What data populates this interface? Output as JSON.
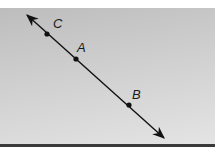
{
  "figure": {
    "type": "line-through-points",
    "colors": {
      "panel_top": "#bdbdbd",
      "panel_bottom": "#e4e4e4",
      "line": "#111111",
      "bottom_rule": "#3a3a3a"
    },
    "line": {
      "x1": 27,
      "y1": 15,
      "x2": 164,
      "y2": 138,
      "arrows": "both"
    },
    "points": [
      {
        "label": "C",
        "x": 47,
        "y": 34,
        "label_x": 55,
        "label_y": 27
      },
      {
        "label": "A",
        "x": 76,
        "y": 59,
        "label_x": 78,
        "label_y": 51
      },
      {
        "label": "B",
        "x": 129,
        "y": 105,
        "label_x": 133,
        "label_y": 98
      }
    ]
  }
}
